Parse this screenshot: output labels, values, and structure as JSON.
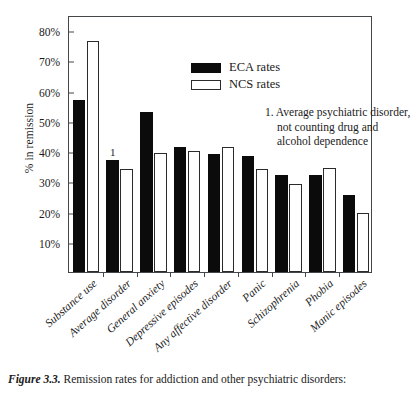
{
  "chart_data": {
    "type": "bar",
    "title": "",
    "xlabel": "",
    "ylabel": "% in remission",
    "ylim": [
      0,
      85
    ],
    "ytick_values": [
      10,
      20,
      30,
      40,
      50,
      60,
      70,
      80
    ],
    "ytick_labels": [
      "10%",
      "20%",
      "30%",
      "40%",
      "50%",
      "60%",
      "70%",
      "80%"
    ],
    "grid": false,
    "legend_position": "top-center",
    "categories": [
      "Substance use",
      "Average disorder",
      "General anxiety",
      "Depressive episodes",
      "Any affective disorder",
      "Panic",
      "Schizophrenia",
      "Phobia",
      "Manic episodes"
    ],
    "series": [
      {
        "name": "ECA rates",
        "color": "#0b0b0b",
        "values": [
          57,
          37,
          53,
          41.5,
          39,
          38.5,
          32,
          32,
          25.5
        ]
      },
      {
        "name": "NCS rates",
        "color": "#ffffff",
        "values": [
          76.5,
          34,
          39.5,
          40,
          41.5,
          34,
          29,
          34.5,
          19.5
        ]
      }
    ],
    "bar_notes": [
      {
        "category_index": 1,
        "series_index": 0,
        "text": "1"
      }
    ],
    "annotation": {
      "line1": "1. Average psychiatric disorder,",
      "line2": "not counting drug and",
      "line3": "alcohol dependence"
    }
  },
  "legend": {
    "items": [
      {
        "label": "ECA rates",
        "style": "filled"
      },
      {
        "label": "NCS rates",
        "style": "outlined"
      }
    ]
  },
  "caption": {
    "label": "Figure 3.3.",
    "text": "Remission rates for addiction and other psychiatric disorders:"
  }
}
